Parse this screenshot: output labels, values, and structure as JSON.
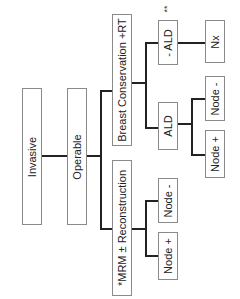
{
  "diagram": {
    "orientation": "rotated-90-ccw",
    "nodes": {
      "invasive": "Invasive",
      "operable": "Operable",
      "breast_conservation": "Breast Conservation +RT",
      "mrm": "*MRM ± Reconstruction",
      "ald": "ALD",
      "no_ald": "- ALD",
      "nx": "Nx",
      "ald_node_neg": "Node -",
      "ald_node_pos": "Node +",
      "mrm_node_neg": "Node -",
      "mrm_node_pos": "Node +"
    },
    "annotations": {
      "no_ald_marker": "**"
    },
    "edges": [
      [
        "Invasive",
        "Operable"
      ],
      [
        "Operable",
        "Breast Conservation +RT"
      ],
      [
        "Operable",
        "*MRM ± Reconstruction"
      ],
      [
        "Breast Conservation +RT",
        "- ALD"
      ],
      [
        "Breast Conservation +RT",
        "ALD"
      ],
      [
        "- ALD",
        "Nx"
      ],
      [
        "ALD",
        "Node -"
      ],
      [
        "ALD",
        "Node +"
      ],
      [
        "*MRM ± Reconstruction",
        "Node -"
      ],
      [
        "*MRM ± Reconstruction",
        "Node +"
      ]
    ]
  }
}
